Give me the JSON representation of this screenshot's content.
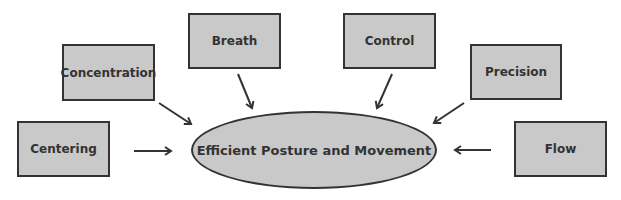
{
  "diagram": {
    "center": {
      "label": "Efficient Posture and Movement"
    },
    "nodes": [
      {
        "id": "concentration",
        "label": "Concentration"
      },
      {
        "id": "breath",
        "label": "Breath"
      },
      {
        "id": "control",
        "label": "Control"
      },
      {
        "id": "precision",
        "label": "Precision"
      },
      {
        "id": "centering",
        "label": "Centering"
      },
      {
        "id": "flow",
        "label": "Flow"
      }
    ],
    "edges": [
      {
        "from": "concentration",
        "to": "center"
      },
      {
        "from": "breath",
        "to": "center"
      },
      {
        "from": "control",
        "to": "center"
      },
      {
        "from": "precision",
        "to": "center"
      },
      {
        "from": "centering",
        "to": "center"
      },
      {
        "from": "flow",
        "to": "center"
      }
    ],
    "colors": {
      "fill": "#c9c9c9",
      "stroke": "#333333",
      "text": "#333333"
    }
  }
}
